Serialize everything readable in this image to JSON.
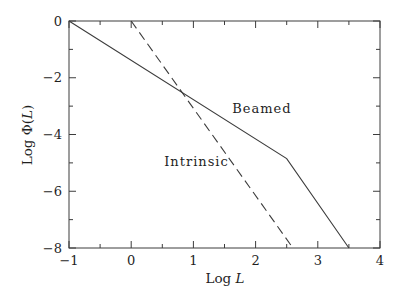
{
  "chart_data": {
    "type": "line",
    "title": "",
    "xlabel": {
      "word": "Log",
      "var": "L"
    },
    "ylabel": {
      "word": "Log",
      "func": "Φ(",
      "var": "L",
      "close": ")"
    },
    "xlim": [
      -1,
      4
    ],
    "ylim": [
      -8,
      0
    ],
    "x_major_ticks": [
      -1,
      0,
      1,
      2,
      3,
      4
    ],
    "x_tick_labels": [
      "−1",
      "0",
      "1",
      "2",
      "3",
      "4"
    ],
    "x_minor_step": 0.5,
    "y_major_ticks": [
      0,
      -2,
      -4,
      -6,
      -8
    ],
    "y_tick_labels": [
      "0",
      "−2",
      "−4",
      "−6",
      "−8"
    ],
    "y_minor_step": 1,
    "grid": false,
    "frame": "box",
    "tick_direction": "in",
    "legend_position": "none",
    "series": [
      {
        "name": "Beamed",
        "line_style": "solid",
        "color": "#3c3c3c",
        "points": [
          [
            -1,
            0
          ],
          [
            2.5,
            -4.85
          ],
          [
            3.5,
            -8
          ]
        ]
      },
      {
        "name": "Intrinsic",
        "line_style": "dashed",
        "color": "#3c3c3c",
        "points": [
          [
            0,
            0
          ],
          [
            2.6,
            -8
          ]
        ]
      }
    ],
    "annotations": [
      {
        "text": "Beamed",
        "x": 2.1,
        "y": -3.05
      },
      {
        "text": "Intrinsic",
        "x": 1.05,
        "y": -4.95
      }
    ]
  },
  "colors": {
    "axis": "#3c3c3c",
    "text": "#1f1f1f",
    "background": "#ffffff"
  }
}
